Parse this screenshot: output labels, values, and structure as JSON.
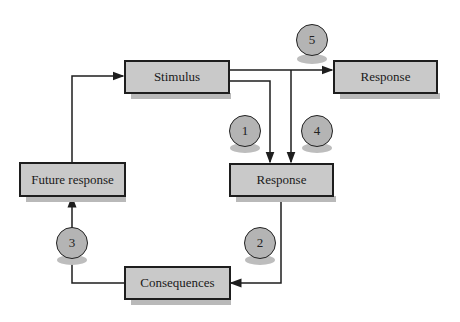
{
  "diagram": {
    "nodes": {
      "stimulus": "Stimulus",
      "response_top": "Response",
      "response_mid": "Response",
      "future_response": "Future response",
      "consequences": "Consequences"
    },
    "markers": [
      "1",
      "2",
      "3",
      "4",
      "5"
    ],
    "edges": [
      {
        "from": "Future response",
        "to": "Stimulus"
      },
      {
        "from": "Stimulus",
        "to": "Response (right)",
        "marker": "5"
      },
      {
        "from": "Stimulus",
        "to": "Response (middle)",
        "marker": "1"
      },
      {
        "from": "Stimulus",
        "to": "Response (middle)",
        "marker": "4"
      },
      {
        "from": "Response (middle)",
        "to": "Consequences",
        "marker": "2"
      },
      {
        "from": "Consequences",
        "to": "Future response",
        "marker": "3"
      }
    ],
    "colors": {
      "box_fill": "#c9c9c9",
      "circle_fill": "#b4b4b4",
      "line": "#1e1e1e"
    }
  }
}
